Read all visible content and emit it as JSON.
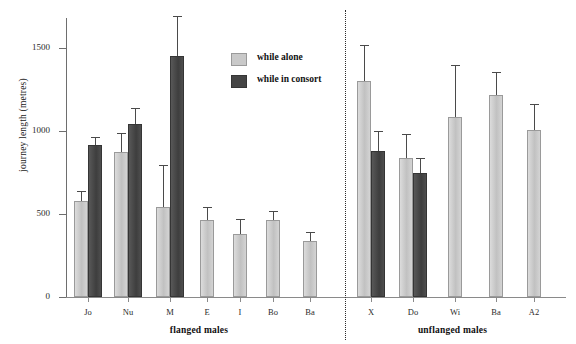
{
  "chart_data": {
    "type": "bar",
    "title": "",
    "xlabel": "",
    "ylabel": "journey length (metres)",
    "ylim": [
      0,
      1700
    ],
    "yticks": [
      0,
      500,
      1000,
      1500
    ],
    "ytick_labels": [
      "0",
      "500",
      "1000",
      "1500"
    ],
    "grid": false,
    "legend_position": "upper-center",
    "legend": [
      {
        "key": "alone",
        "label": "while alone",
        "color": "#c9c9c9"
      },
      {
        "key": "consort",
        "label": "while in consort",
        "color": "#454545"
      }
    ],
    "series": [
      {
        "name": "while alone",
        "key": "alone",
        "color": "#c9c9c9"
      },
      {
        "name": "while in consort",
        "key": "consort",
        "color": "#454545"
      }
    ],
    "groups": [
      {
        "label": "flanged males",
        "categories": [
          "Jo",
          "Nu",
          "M",
          "E",
          "I",
          "Bo",
          "Ba"
        ]
      },
      {
        "label": "unflanged males",
        "categories": [
          "X",
          "Do",
          "Wi",
          "Ba",
          "A2"
        ]
      }
    ],
    "categories": [
      "Jo",
      "Nu",
      "M",
      "E",
      "I",
      "Bo",
      "Ba",
      "X",
      "Do",
      "Wi",
      "Ba",
      "A2"
    ],
    "points": [
      {
        "category": "Jo",
        "group": "flanged males",
        "alone": 580,
        "alone_err_high": 640,
        "consort": 915,
        "consort_err_high": 965
      },
      {
        "category": "Nu",
        "group": "flanged males",
        "alone": 875,
        "alone_err_high": 990,
        "consort": 1045,
        "consort_err_high": 1140
      },
      {
        "category": "M",
        "group": "flanged males",
        "alone": 545,
        "alone_err_high": 795,
        "consort": 1450,
        "consort_err_high": 1690
      },
      {
        "category": "E",
        "group": "flanged males",
        "alone": 465,
        "alone_err_high": 540,
        "consort": null,
        "consort_err_high": null
      },
      {
        "category": "I",
        "group": "flanged males",
        "alone": 378,
        "alone_err_high": 470,
        "consort": null,
        "consort_err_high": null
      },
      {
        "category": "Bo",
        "group": "flanged males",
        "alone": 465,
        "alone_err_high": 520,
        "consort": null,
        "consort_err_high": null
      },
      {
        "category": "Ba",
        "group": "flanged males",
        "alone": 340,
        "alone_err_high": 390,
        "consort": null,
        "consort_err_high": null
      },
      {
        "category": "X",
        "group": "unflanged males",
        "alone": 1300,
        "alone_err_high": 1520,
        "consort": 880,
        "consort_err_high": 1000
      },
      {
        "category": "Do",
        "group": "unflanged males",
        "alone": 835,
        "alone_err_high": 980,
        "consort": 745,
        "consort_err_high": 835
      },
      {
        "category": "Wi",
        "group": "unflanged males",
        "alone": 1085,
        "alone_err_high": 1395,
        "consort": null,
        "consort_err_high": null
      },
      {
        "category": "Ba",
        "group": "unflanged males",
        "alone": 1215,
        "alone_err_high": 1355,
        "consort": null,
        "consort_err_high": null
      },
      {
        "category": "A2",
        "group": "unflanged males",
        "alone": 1005,
        "alone_err_high": 1160,
        "consort": null,
        "consort_err_high": null
      }
    ]
  }
}
